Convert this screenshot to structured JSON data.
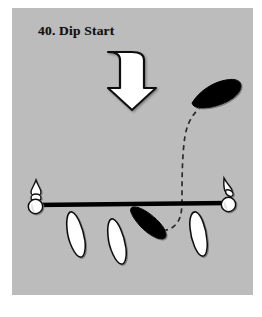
{
  "figure": {
    "number": "40.",
    "name": "Dip Start",
    "title": "40.  Dip Start",
    "caption_text": "40.  Dip Start"
  },
  "colors": {
    "page_background": "#ffffff",
    "panel_background": "#bcbcbc",
    "ink": "#000000",
    "highlight_fill": "#ffffff",
    "shadow": "#8f8f8f",
    "dashed_path": "#303030"
  },
  "panel": {
    "left": 12,
    "top": 8,
    "width": 241,
    "height": 287
  },
  "apparatus": {
    "bar": {
      "label": "horizontal-bar",
      "x1": 21,
      "y1": 197,
      "x2": 216,
      "y2": 196,
      "thickness": 4
    },
    "left_post": {
      "label": "left-upright-post",
      "x": 22,
      "y": 196,
      "ball_radius": 7,
      "finial_height": 26
    },
    "right_post": {
      "label": "right-upright-post",
      "x": 216,
      "y": 195,
      "ball_radius": 7,
      "finial_height": 26
    }
  },
  "arrow": {
    "label": "downward-motion-arrow",
    "direction": "down",
    "fill": "#ffffff",
    "stroke": "#000000",
    "center_x": 120,
    "top_y": 42,
    "bottom_y": 102,
    "shaft_width": 26,
    "head_width": 44
  },
  "trajectory": {
    "label": "dashed-swing-path",
    "style": "dashed",
    "dash_pattern": "5 4",
    "stroke_width": 1.6,
    "description": "curved dashed path from upper body position down around the bar"
  },
  "body_positions": [
    {
      "id": "pos-start-above",
      "label": "start-position-above-bar",
      "state": "filled",
      "fill": "#000000",
      "cx": 206,
      "cy": 85,
      "rx": 27,
      "ry": 9,
      "rotation": -20
    },
    {
      "id": "pos-under-bar",
      "label": "dip-position-under-bar",
      "state": "filled",
      "fill": "#000000",
      "cx": 143,
      "cy": 217,
      "rx": 26,
      "ry": 9,
      "rotation": 28
    },
    {
      "id": "pos-ghost-1",
      "label": "ghost-position-1",
      "state": "outline",
      "fill": "#ffffff",
      "cx": 67,
      "cy": 228,
      "rx": 25,
      "ry": 9,
      "rotation": 68
    },
    {
      "id": "pos-ghost-2",
      "label": "ghost-position-2",
      "state": "outline",
      "fill": "#ffffff",
      "cx": 110,
      "cy": 234,
      "rx": 25,
      "ry": 9,
      "rotation": 70
    },
    {
      "id": "pos-ghost-3",
      "label": "ghost-position-3",
      "state": "outline",
      "fill": "#ffffff",
      "cx": 192,
      "cy": 227,
      "rx": 25,
      "ry": 9,
      "rotation": 72
    }
  ]
}
